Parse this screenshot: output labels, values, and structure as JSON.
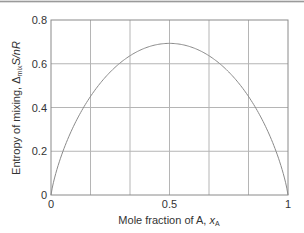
{
  "chart_data": {
    "type": "line",
    "title": "",
    "xlabel": "Mole fraction of A, x_A",
    "ylabel": "Entropy of mixing, Δ_mix S/nR",
    "xlim": [
      0,
      1
    ],
    "ylim": [
      0,
      0.8
    ],
    "x_ticks": [
      "0",
      "0.5",
      "1"
    ],
    "y_ticks": [
      "0",
      "0.2",
      "0.4",
      "0.6",
      "0.8"
    ],
    "grid": true,
    "vertical_gridlines": 6,
    "legend": null,
    "series": [
      {
        "name": "ΔmixS/nR",
        "x": [
          0,
          0.05,
          0.1,
          0.2,
          0.3,
          0.4,
          0.5,
          0.6,
          0.7,
          0.8,
          0.9,
          0.95,
          1
        ],
        "y": [
          0,
          0.199,
          0.325,
          0.5,
          0.611,
          0.673,
          0.693,
          0.673,
          0.611,
          0.5,
          0.325,
          0.199,
          0
        ]
      }
    ]
  },
  "axes": {
    "xlabel_main": "Mole fraction of A, ",
    "xlabel_var": "x",
    "xlabel_sub": "A",
    "ylabel_main": "Entropy of mixing, Δ",
    "ylabel_sub": "mix",
    "ylabel_tail": "S/nR"
  },
  "colors": {
    "curve": "#8a8a8a",
    "grid": "#b5b5b5",
    "frame": "#8a8a8a"
  }
}
